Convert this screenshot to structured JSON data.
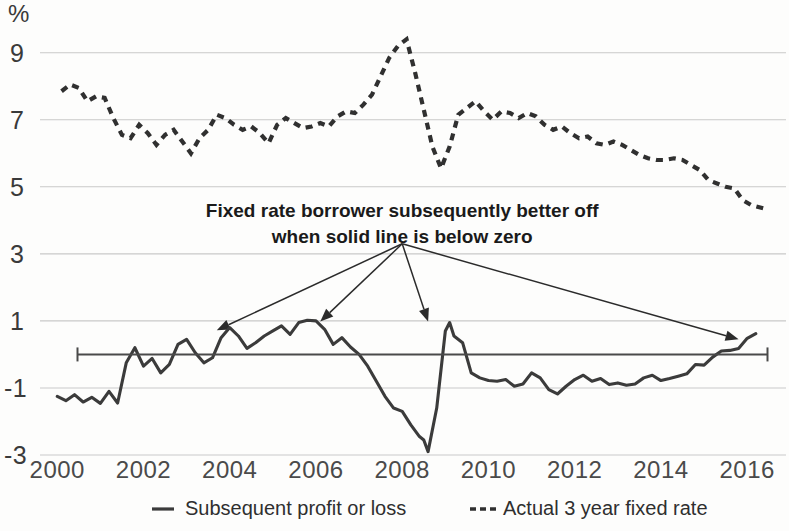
{
  "chart_data": {
    "type": "line",
    "title": "",
    "subtitle": "",
    "xlabel": "",
    "ylabel": "%",
    "unit_label": "%",
    "xlim": [
      1999.6,
      2016.9
    ],
    "ylim": [
      -4.0,
      10.0
    ],
    "grid": true,
    "gridlines_at": [
      9,
      7,
      5,
      3,
      1,
      -1,
      -3
    ],
    "zero_reference_line": 0,
    "legend_position": "bottom",
    "xticks": [
      2000,
      2002,
      2004,
      2006,
      2008,
      2010,
      2012,
      2014,
      2016
    ],
    "xtick_labels": [
      "2000",
      "2002",
      "2004",
      "2006",
      "2008",
      "2010",
      "2012",
      "2014",
      "2016"
    ],
    "yticks": [
      9,
      7,
      5,
      3,
      1,
      -1,
      -3
    ],
    "ytick_labels": [
      "9",
      "7",
      "5",
      "3",
      "1",
      "-1",
      "-3"
    ],
    "annotations": [
      {
        "name": "callout-note",
        "lines": [
          "Fixed rate borrower subsequently better off",
          "when solid line is below zero"
        ],
        "x": 2008.0,
        "y": 4.1
      }
    ],
    "callout_arrows": [
      {
        "from_x": 2008.0,
        "from_y": 3.3,
        "to_x": 2003.7,
        "to_y": 0.72
      },
      {
        "from_x": 2008.0,
        "from_y": 3.3,
        "to_x": 2006.1,
        "to_y": 0.98
      },
      {
        "from_x": 2008.0,
        "from_y": 3.3,
        "to_x": 2008.6,
        "to_y": 0.98
      },
      {
        "from_x": 2008.0,
        "from_y": 3.3,
        "to_x": 2015.8,
        "to_y": 0.45
      }
    ],
    "series": [
      {
        "name": "Subsequent profit or loss",
        "style": "solid",
        "color": "#3b3b3b",
        "x": [
          2000.0,
          2000.2,
          2000.4,
          2000.6,
          2000.8,
          2001.0,
          2001.2,
          2001.4,
          2001.6,
          2001.8,
          2002.0,
          2002.2,
          2002.4,
          2002.6,
          2002.8,
          2003.0,
          2003.2,
          2003.4,
          2003.6,
          2003.8,
          2004.0,
          2004.2,
          2004.4,
          2004.6,
          2004.8,
          2005.0,
          2005.2,
          2005.4,
          2005.6,
          2005.8,
          2006.0,
          2006.2,
          2006.4,
          2006.6,
          2006.8,
          2007.0,
          2007.2,
          2007.4,
          2007.6,
          2007.8,
          2008.0,
          2008.2,
          2008.4,
          2008.5,
          2008.6,
          2008.8,
          2009.0,
          2009.1,
          2009.2,
          2009.4,
          2009.6,
          2009.8,
          2010.0,
          2010.2,
          2010.4,
          2010.6,
          2010.8,
          2011.0,
          2011.2,
          2011.4,
          2011.6,
          2011.8,
          2012.0,
          2012.2,
          2012.4,
          2012.6,
          2012.8,
          2013.0,
          2013.2,
          2013.4,
          2013.6,
          2013.8,
          2014.0,
          2014.2,
          2014.4,
          2014.6,
          2014.8,
          2015.0,
          2015.2,
          2015.4,
          2015.6,
          2015.8,
          2016.0,
          2016.2
        ],
        "values": [
          -1.25,
          -1.38,
          -1.2,
          -1.42,
          -1.28,
          -1.46,
          -1.1,
          -1.45,
          -0.25,
          0.2,
          -0.35,
          -0.12,
          -0.55,
          -0.3,
          0.3,
          0.45,
          0.05,
          -0.25,
          -0.1,
          0.5,
          0.8,
          0.55,
          0.18,
          0.35,
          0.55,
          0.7,
          0.85,
          0.6,
          0.95,
          1.02,
          1.0,
          0.75,
          0.3,
          0.5,
          0.22,
          0.0,
          -0.35,
          -0.8,
          -1.25,
          -1.6,
          -1.7,
          -2.1,
          -2.45,
          -2.55,
          -2.9,
          -1.6,
          0.7,
          0.95,
          0.55,
          0.35,
          -0.55,
          -0.7,
          -0.78,
          -0.8,
          -0.75,
          -0.95,
          -0.88,
          -0.55,
          -0.7,
          -1.05,
          -1.18,
          -0.95,
          -0.75,
          -0.62,
          -0.8,
          -0.72,
          -0.9,
          -0.85,
          -0.92,
          -0.88,
          -0.7,
          -0.62,
          -0.78,
          -0.72,
          -0.65,
          -0.58,
          -0.3,
          -0.32,
          -0.08,
          0.1,
          0.12,
          0.18,
          0.48,
          0.62
        ]
      },
      {
        "name": "Actual 3 year fixed rate",
        "style": "dashed",
        "color": "#303030",
        "x": [
          2000.1,
          2000.3,
          2000.5,
          2000.7,
          2000.9,
          2001.1,
          2001.3,
          2001.5,
          2001.7,
          2001.9,
          2002.1,
          2002.3,
          2002.5,
          2002.7,
          2002.9,
          2003.1,
          2003.3,
          2003.5,
          2003.7,
          2003.9,
          2004.1,
          2004.3,
          2004.5,
          2004.7,
          2004.9,
          2005.1,
          2005.3,
          2005.5,
          2005.7,
          2005.9,
          2006.1,
          2006.3,
          2006.5,
          2006.7,
          2006.9,
          2007.1,
          2007.3,
          2007.5,
          2007.7,
          2007.9,
          2008.1,
          2008.3,
          2008.5,
          2008.7,
          2008.9,
          2009.1,
          2009.3,
          2009.5,
          2009.7,
          2009.9,
          2010.1,
          2010.3,
          2010.5,
          2010.7,
          2010.9,
          2011.1,
          2011.3,
          2011.5,
          2011.7,
          2011.9,
          2012.1,
          2012.3,
          2012.5,
          2012.7,
          2012.9,
          2013.1,
          2013.3,
          2013.5,
          2013.7,
          2013.9,
          2014.1,
          2014.3,
          2014.5,
          2014.7,
          2014.9,
          2015.1,
          2015.3,
          2015.5,
          2015.7,
          2015.9,
          2016.1,
          2016.4
        ],
        "values": [
          7.85,
          8.05,
          7.95,
          7.55,
          7.7,
          7.65,
          7.05,
          6.55,
          6.45,
          6.85,
          6.6,
          6.25,
          6.55,
          6.7,
          6.35,
          6.0,
          6.45,
          6.7,
          7.15,
          7.05,
          6.85,
          6.7,
          6.8,
          6.6,
          6.3,
          6.85,
          7.05,
          6.9,
          6.75,
          6.8,
          6.9,
          6.8,
          7.1,
          7.25,
          7.2,
          7.45,
          7.75,
          8.3,
          8.85,
          9.2,
          9.4,
          8.4,
          7.3,
          6.2,
          5.55,
          6.2,
          7.15,
          7.35,
          7.55,
          7.25,
          7.0,
          7.25,
          7.2,
          7.05,
          7.2,
          7.1,
          6.85,
          6.7,
          6.8,
          6.6,
          6.45,
          6.5,
          6.3,
          6.25,
          6.35,
          6.25,
          6.1,
          5.95,
          5.85,
          5.8,
          5.8,
          5.85,
          5.8,
          5.65,
          5.5,
          5.2,
          5.1,
          5.0,
          4.95,
          4.6,
          4.45,
          4.35
        ]
      }
    ],
    "legend": [
      {
        "label": "Subsequent profit or loss",
        "style": "solid"
      },
      {
        "label": "Actual 3 year fixed rate",
        "style": "dashed"
      }
    ]
  }
}
